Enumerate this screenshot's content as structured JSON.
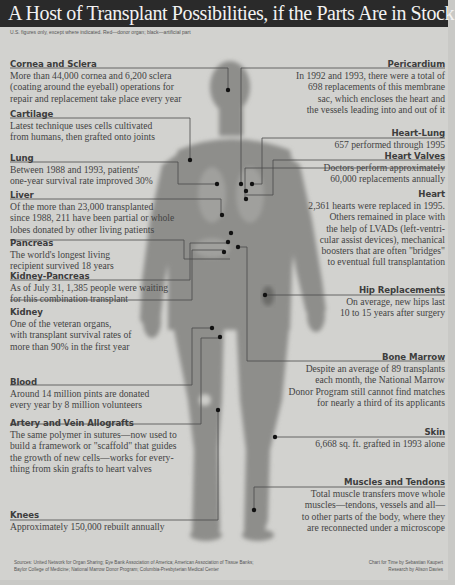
{
  "header": {
    "title": "A Host of Transplant Possibilities, if the Parts Are in Stock",
    "subtitle": "U.S. figures only, except where indicated. Red—donor organ; black—artificial part"
  },
  "callouts": {
    "cornea": {
      "heading": "Cornea and Sclera",
      "text": "More than 44,000 cornea and 6,200 sclera\n(coating around the eyeball) operations for\nrepair and replacement take place every year"
    },
    "cartilage": {
      "heading": "Cartilage",
      "text": "Latest technique uses cells cultivated\nfrom humans, then grafted onto joints"
    },
    "lung": {
      "heading": "Lung",
      "text": "Between 1988 and 1993, patients'\none-year survival rate improved 30%"
    },
    "liver": {
      "heading": "Liver",
      "text": "Of the more than 23,000 transplanted\nsince 1988, 211 have been partial or whole\nlobes donated by other living patients"
    },
    "pancreas": {
      "heading": "Pancreas",
      "text": "The world's longest living\nrecipient survived 18 years"
    },
    "kidney_pancreas": {
      "heading": "Kidney-Pancreas",
      "text": "As of July 31, 1,385 people were waiting\nfor this combination transplant"
    },
    "kidney": {
      "heading": "Kidney",
      "text": "One of the veteran organs,\nwith transplant survival rates of\nmore than 90% in the first year"
    },
    "blood": {
      "heading": "Blood",
      "text": "Around 14 million pints are donated\nevery year by 8 million volunteers"
    },
    "artery": {
      "heading": "Artery and Vein Allografts",
      "text": "The same polymer in sutures—now used to\nbuild a framework or \"scaffold\" that guides\nthe growth of new cells—works for every-\nthing from skin grafts to heart valves"
    },
    "knees": {
      "heading": "Knees",
      "text": "Approximately 150,000 rebuilt annually"
    },
    "pericardium": {
      "heading": "Pericardium",
      "text": "In 1992 and 1993, there were a total of\n698 replacements of this membrane\nsac, which encloses the heart and\nthe vessels leading into and out of it"
    },
    "heart_lung": {
      "heading": "Heart-Lung",
      "text": "657 performed through 1995"
    },
    "heart_valves": {
      "heading": "Heart Valves",
      "text": "Doctors perform approximately\n60,000 replacements annually"
    },
    "heart": {
      "heading": "Heart",
      "text": "2,361 hearts were replaced in 1995.\nOthers remained in place with\nthe help of LVADs (left-ventri-\ncular assist devices), mechanical\nboosters that are often \"bridges\"\nto eventual full transplantation"
    },
    "hip": {
      "heading": "Hip Replacements",
      "text": "On average, new hips last\n10 to 15 years after surgery"
    },
    "bone_marrow": {
      "heading": "Bone Marrow",
      "text": "Despite an average of 89 transplants\neach month, the National Marrow\nDonor Program still cannot find matches\nfor nearly a third of its applicants"
    },
    "skin": {
      "heading": "Skin",
      "text": "6,668 sq. ft. grafted in 1993 alone"
    },
    "muscles": {
      "heading": "Muscles and Tendons",
      "text": "Total muscle transfers move whole\nmuscles—tendons, vessels and all—\nto other parts of the body, where they\nare reconnected under a microscope"
    }
  },
  "footer": {
    "sources": "Sources: United Network for Organ Sharing; Eye Bank Association of America; American Association of Tissue Banks;\nBaylor College of Medicine; National Marrow Donor Program; Columbia-Presbyterian Medical Center",
    "credits": "Chart for Time by Sebastian Kaupert\nResearch by Alison Davies"
  },
  "colors": {
    "title_bar": "#2a2a2a",
    "background": "#d2d2cf",
    "figure": "#8c8c8a",
    "connector": "#4a4a4a",
    "marker": "#111111"
  }
}
